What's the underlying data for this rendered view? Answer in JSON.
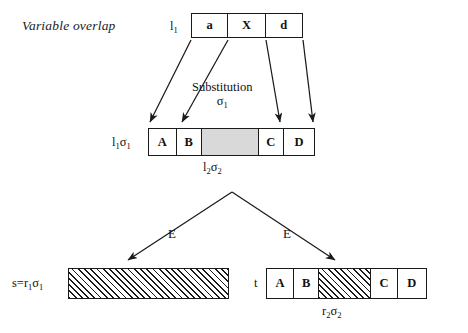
{
  "caption": "Variable overlap",
  "colors": {
    "stroke": "#1a1a1a",
    "shaded_fill": "#d9d9d9",
    "background": "#ffffff"
  },
  "top_term": {
    "label": "l₁",
    "label_plain": "l1",
    "cells": [
      "a",
      "X",
      "d"
    ]
  },
  "substitution": {
    "title": "Substitution",
    "symbol": "σ₁",
    "symbol_plain": "sigma1",
    "arrow_count": 4
  },
  "mid_term": {
    "label": "l₁σ₁",
    "label_plain": "l1sigma1",
    "sublabel": "l₂σ₂",
    "sublabel_plain": "l2sigma2",
    "cells": [
      {
        "text": "A",
        "style": "plain"
      },
      {
        "text": "B",
        "style": "plain"
      },
      {
        "text": "",
        "style": "shaded"
      },
      {
        "text": "C",
        "style": "plain"
      },
      {
        "text": "D",
        "style": "plain"
      }
    ]
  },
  "rewrite": {
    "left_edge_label": "E",
    "right_edge_label": "E"
  },
  "left_term": {
    "label": "s=r₁σ₁",
    "label_plain": "s=r1sigma1",
    "cells": [
      {
        "text": "",
        "style": "hatched"
      }
    ]
  },
  "right_term": {
    "label": "t",
    "sublabel": "r₂σ₂",
    "sublabel_plain": "r2sigma2",
    "cells": [
      {
        "text": "A",
        "style": "plain"
      },
      {
        "text": "B",
        "style": "plain"
      },
      {
        "text": "",
        "style": "hatched"
      },
      {
        "text": "C",
        "style": "plain"
      },
      {
        "text": "D",
        "style": "plain"
      }
    ]
  }
}
